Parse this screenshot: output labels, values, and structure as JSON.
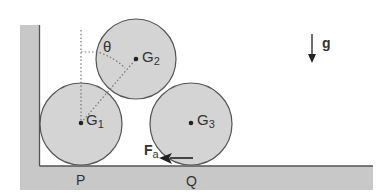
{
  "figure": {
    "bodies": [
      {
        "id": "G1",
        "label": "G",
        "subscript": "1"
      },
      {
        "id": "G2",
        "label": "G",
        "subscript": "2"
      },
      {
        "id": "G3",
        "label": "G",
        "subscript": "3"
      }
    ],
    "angle_label": "θ",
    "gravity_label": "g",
    "force_label": "F",
    "force_subscript": "a",
    "contact_points": [
      {
        "label": "P"
      },
      {
        "label": "Q"
      }
    ],
    "colors": {
      "ground_fill": "#c8c8c8",
      "circle_fill": "#d4d4d4",
      "outline": "#555555",
      "text": "#333333",
      "arrow": "#222222"
    }
  }
}
